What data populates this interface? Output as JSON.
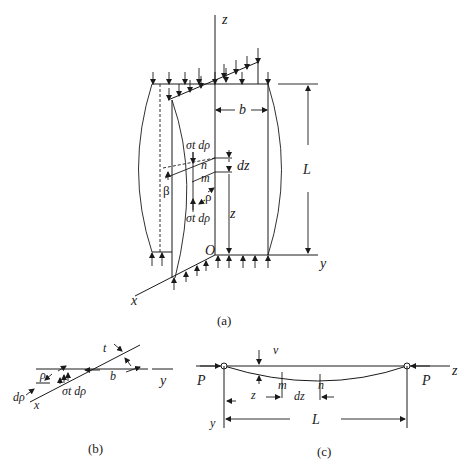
{
  "figure": {
    "panel_a": {
      "caption": "(a)",
      "labels": {
        "z_axis": "z",
        "y_axis": "y",
        "x_axis": "x",
        "origin": "O",
        "width": "b",
        "length": "L",
        "dz": "dz",
        "z_coord": "z",
        "point_n": "n",
        "point_m": "m",
        "rho": "ρ",
        "beta": "β",
        "force_top": "σt dρ",
        "force_bottom": "σt dρ"
      }
    },
    "panel_b": {
      "caption": "(b)",
      "labels": {
        "thickness": "t",
        "rho": "ρ",
        "d_rho": "dρ",
        "force": "σt dρ",
        "width": "b",
        "y_axis": "y",
        "x_axis": "x"
      }
    },
    "panel_c": {
      "caption": "(c)",
      "labels": {
        "load_left": "P",
        "load_right": "P",
        "z_axis": "z",
        "y_axis": "y",
        "deflection": "v",
        "z_coord": "z",
        "point_m": "m",
        "point_n": "n",
        "dz": "dz",
        "length": "L"
      }
    }
  }
}
